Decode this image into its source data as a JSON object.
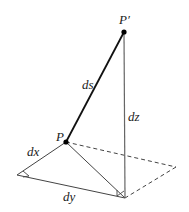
{
  "diagram": {
    "type": "3d-line-element",
    "points": {
      "P": {
        "label": "P",
        "x": 66,
        "y": 142
      },
      "P_prime": {
        "label": "P′",
        "x": 124,
        "y": 32
      },
      "L": {
        "x": 17,
        "y": 175
      },
      "Q": {
        "x": 125,
        "y": 198
      },
      "R": {
        "x": 176,
        "y": 167
      }
    },
    "labels": {
      "ds": "ds",
      "dx": "dx",
      "dy": "dy",
      "dz": "dz",
      "P": "P",
      "P_prime": "P′"
    },
    "colors": {
      "ds_line": "#111111",
      "thin_line": "#444444",
      "dashed": "#444444",
      "point": "#000000"
    }
  }
}
